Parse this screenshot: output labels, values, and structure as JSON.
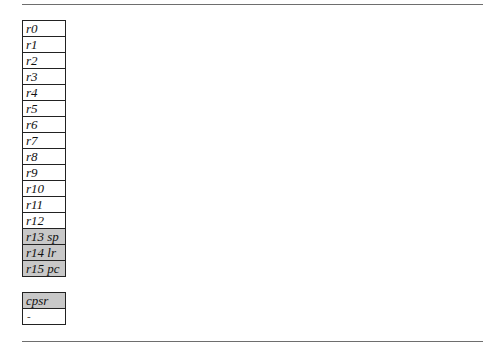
{
  "registers": [
    {
      "label": "r0",
      "shaded": false
    },
    {
      "label": "r1",
      "shaded": false
    },
    {
      "label": "r2",
      "shaded": false
    },
    {
      "label": "r3",
      "shaded": false
    },
    {
      "label": "r4",
      "shaded": false
    },
    {
      "label": "r5",
      "shaded": false
    },
    {
      "label": "r6",
      "shaded": false
    },
    {
      "label": "r7",
      "shaded": false
    },
    {
      "label": "r8",
      "shaded": false
    },
    {
      "label": "r9",
      "shaded": false
    },
    {
      "label": "r10",
      "shaded": false
    },
    {
      "label": "r11",
      "shaded": false
    },
    {
      "label": "r12",
      "shaded": false
    },
    {
      "label": "r13 sp",
      "shaded": true
    },
    {
      "label": "r14 lr",
      "shaded": true
    },
    {
      "label": "r15 pc",
      "shaded": true
    }
  ],
  "status_register": {
    "label": "cpsr",
    "value": "-"
  },
  "colors": {
    "shaded_row": "#c8c8c8",
    "border": "#222222",
    "rule": "#6e6e6e"
  }
}
